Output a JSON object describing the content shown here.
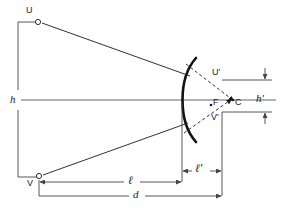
{
  "figure": {
    "background_color": "#ffffff",
    "stroke_color": "#1a1a1a",
    "axis_color": "#555555",
    "dimension_color": "#444444",
    "width": 281,
    "height": 218
  },
  "points": {
    "object_top": {
      "label": "U",
      "x": 38,
      "y": 22,
      "label_x": 26,
      "label_y": 8
    },
    "object_bottom": {
      "label": "V",
      "x": 39,
      "y": 176,
      "label_x": 27,
      "label_y": 179
    },
    "image_top": {
      "label": "U'",
      "x": 224,
      "y": 80,
      "label_x": 212,
      "label_y": 68
    },
    "image_bottom": {
      "label": "V'",
      "x": 222,
      "y": 112,
      "label_x": 211,
      "label_y": 113
    },
    "focus": {
      "label": "F",
      "x": 211,
      "y": 104,
      "label_x": 213,
      "label_y": 99
    },
    "center": {
      "label": "C",
      "x": 236,
      "y": 100,
      "label_x": 234,
      "label_y": 99
    }
  },
  "dimensions": {
    "object_height": {
      "label": "h",
      "label_x": 10,
      "label_y": 96
    },
    "image_height": {
      "label": "h′",
      "label_x": 256,
      "label_y": 95
    },
    "object_distance": {
      "label": "ℓ",
      "label_x": 128,
      "label_y": 176
    },
    "image_distance": {
      "label": "ℓ′",
      "label_x": 196,
      "label_y": 164
    },
    "total_distance": {
      "label": "d",
      "label_x": 133,
      "label_y": 191
    }
  },
  "mirror": {
    "name": "concave-mirror-arc",
    "vertex_x": 182,
    "top_y": 58,
    "bottom_y": 142
  },
  "optical_axis": {
    "y": 100,
    "x_start": 21,
    "x_end": 276
  }
}
